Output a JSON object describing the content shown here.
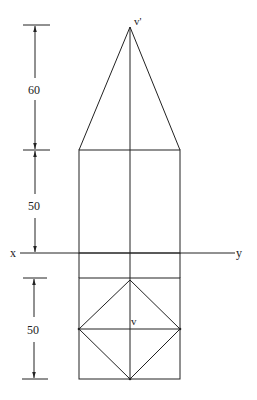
{
  "labels": {
    "apex_elevation": "v'",
    "apex_plan": "v",
    "x_end": "x",
    "y_end": "y"
  },
  "dimensions": {
    "cone_height": "60",
    "cylinder_height": "50",
    "plan_width": "50"
  },
  "colors": {
    "line": "#222222",
    "background": "#ffffff"
  }
}
